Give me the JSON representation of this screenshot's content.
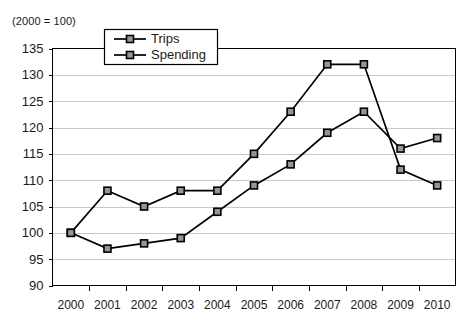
{
  "note": "(2000 = 100)",
  "legend": {
    "trips_label": "Trips",
    "spending_label": "Spending"
  },
  "chart_data": {
    "type": "line",
    "title": "",
    "subtitle": "(2000 = 100)",
    "xlabel": "",
    "ylabel": "",
    "categories": [
      "2000",
      "2001",
      "2002",
      "2003",
      "2004",
      "2005",
      "2006",
      "2007",
      "2008",
      "2009",
      "2010"
    ],
    "series": [
      {
        "name": "Trips",
        "values": [
          100,
          97,
          98,
          99,
          104,
          109,
          113,
          119,
          123,
          116,
          118
        ],
        "marker": "square",
        "marker_fill": "#969696",
        "line_color": "#000000"
      },
      {
        "name": "Spending",
        "values": [
          100,
          108,
          105,
          108,
          108,
          115,
          123,
          132,
          132,
          112,
          109
        ],
        "marker": "square",
        "marker_fill": "#969696",
        "line_color": "#000000"
      }
    ],
    "ylim": [
      90,
      135
    ],
    "yticks": [
      90,
      95,
      100,
      105,
      110,
      115,
      120,
      125,
      130,
      135
    ],
    "ytick_labels": [
      "90",
      "95",
      "100",
      "105",
      "110",
      "115",
      "120",
      "125",
      "130",
      "135"
    ],
    "grid": true,
    "grid_axis": "y",
    "grid_color": "#c9c9c9",
    "legend_position": "top-center-inside",
    "legend_entries": [
      "Trips",
      "Spending"
    ],
    "plot_border": true,
    "background": "#ffffff"
  }
}
